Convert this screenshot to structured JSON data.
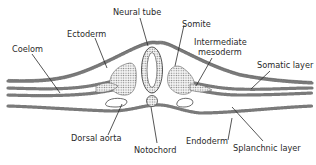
{
  "diagram": {
    "labels": {
      "neural_tube": "Neural tube",
      "ectoderm": "Ectoderm",
      "somite": "Somite",
      "intermediate_mesoderm_1": "Intermediate",
      "intermediate_mesoderm_2": "mesoderm",
      "coelom": "Coelom",
      "somatic_layer": "Somatic layer",
      "dorsal_aorta": "Dorsal aorta",
      "endoderm": "Endoderm",
      "splanchnic_layer": "Splanchnic layer",
      "notochord": "Notochord"
    },
    "colors": {
      "line": "#2a2a2a",
      "tissue": "#7a7a7a",
      "background": "#ffffff"
    }
  }
}
